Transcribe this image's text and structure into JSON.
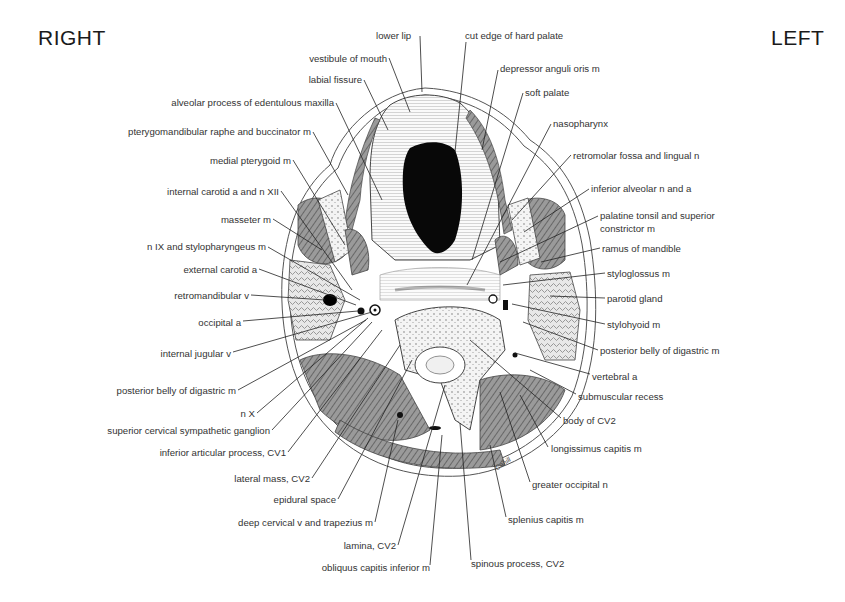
{
  "orientation": {
    "right_label": "RIGHT",
    "left_label": "LEFT"
  },
  "signature": "Cahill",
  "labels": {
    "top": [
      {
        "text": "lower lip",
        "x": 376,
        "y": 30
      },
      {
        "text": "cut edge of hard palate",
        "x": 465,
        "y": 30
      }
    ],
    "left": [
      {
        "text": "vestibule of mouth",
        "right": 387,
        "y": 53
      },
      {
        "text": "labial fissure",
        "right": 362,
        "y": 74
      },
      {
        "text": "alveolar process of edentulous maxilla",
        "right": 334,
        "y": 97
      },
      {
        "text": "pterygomandibular raphe and buccinator m",
        "right": 311,
        "y": 126
      },
      {
        "text": "medial pterygoid m",
        "right": 291,
        "y": 155
      },
      {
        "text": "internal carotid a and n XII",
        "right": 279,
        "y": 186
      },
      {
        "text": "masseter m",
        "right": 271,
        "y": 214
      },
      {
        "text": "n IX and stylopharyngeus m",
        "right": 266,
        "y": 241
      },
      {
        "text": "external carotid a",
        "right": 257,
        "y": 264
      },
      {
        "text": "retromandibular v",
        "right": 249,
        "y": 290
      },
      {
        "text": "occipital a",
        "right": 241,
        "y": 317
      },
      {
        "text": "internal jugular v",
        "right": 231,
        "y": 348
      },
      {
        "text": "posterior belly of digastric m",
        "right": 236,
        "y": 385
      },
      {
        "text": "n X",
        "right": 255,
        "y": 408
      },
      {
        "text": "superior cervical sympathetic ganglion",
        "right": 270,
        "y": 425
      },
      {
        "text": "inferior articular process, CV1",
        "right": 286,
        "y": 447
      },
      {
        "text": "lateral mass, CV2",
        "right": 310,
        "y": 473
      },
      {
        "text": "epidural space",
        "right": 336,
        "y": 494
      },
      {
        "text": "deep cervical v and trapezius m",
        "right": 373,
        "y": 517
      },
      {
        "text": "lamina, CV2",
        "right": 396,
        "y": 540
      },
      {
        "text": "obliquus capitis inferior m",
        "right": 430,
        "y": 562
      }
    ],
    "right": [
      {
        "text": "depressor anguli oris m",
        "x": 500,
        "y": 63
      },
      {
        "text": "soft palate",
        "x": 525,
        "y": 87
      },
      {
        "text": "nasopharynx",
        "x": 553,
        "y": 118
      },
      {
        "text": "retromolar fossa and lingual n",
        "x": 573,
        "y": 150
      },
      {
        "text": "inferior alveolar n and a",
        "x": 591,
        "y": 183
      },
      {
        "text": "palatine tonsil and superior",
        "x": 600,
        "y": 210
      },
      {
        "text": "constrictor m",
        "x": 600,
        "y": 223
      },
      {
        "text": "ramus of mandible",
        "x": 602,
        "y": 243
      },
      {
        "text": "styloglossus m",
        "x": 607,
        "y": 268
      },
      {
        "text": "parotid gland",
        "x": 607,
        "y": 293
      },
      {
        "text": "stylohyoid m",
        "x": 607,
        "y": 319
      },
      {
        "text": "posterior belly of digastric m",
        "x": 600,
        "y": 345
      },
      {
        "text": "vertebral a",
        "x": 592,
        "y": 371
      },
      {
        "text": "submuscular recess",
        "x": 578,
        "y": 391
      },
      {
        "text": "body of CV2",
        "x": 563,
        "y": 415
      },
      {
        "text": "longissimus capitis m",
        "x": 551,
        "y": 443
      },
      {
        "text": "greater occipital n",
        "x": 532,
        "y": 479
      },
      {
        "text": "splenius capitis m",
        "x": 508,
        "y": 514
      },
      {
        "text": "spinous process, CV2",
        "x": 471,
        "y": 558
      }
    ]
  }
}
